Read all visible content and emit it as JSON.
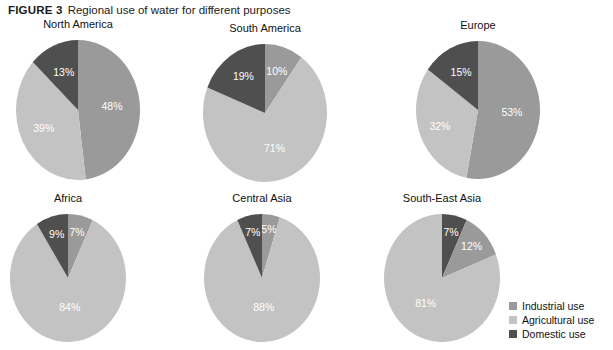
{
  "figure": {
    "label": "FIGURE 3",
    "title": "Regional use of water for different purposes"
  },
  "colors": {
    "industrial": "#9a9a9a",
    "agricultural": "#c3c3c3",
    "domestic": "#4f4f4f",
    "background": "#ffffff",
    "text": "#111111",
    "label_text": "#ffffff"
  },
  "legend": {
    "position": "bottom-right",
    "items": [
      {
        "label": "Industrial use",
        "key": "industrial",
        "color": "#9a9a9a"
      },
      {
        "label": "Agricultural use",
        "key": "agricultural",
        "color": "#c3c3c3"
      },
      {
        "label": "Domestic use",
        "key": "domestic",
        "color": "#4f4f4f"
      }
    ]
  },
  "chart_data": {
    "type": "pie",
    "title": "Regional use of water for different purposes",
    "subtitle": "",
    "xlabel": "",
    "ylabel": "",
    "unit": "percent",
    "legend": [
      "Industrial use",
      "Agricultural use",
      "Domestic use"
    ],
    "legend_position": "bottom-right",
    "grid": false,
    "categories": [
      "Industrial use",
      "Agricultural use",
      "Domestic use"
    ],
    "charts": [
      {
        "title": "North America",
        "row": 0,
        "col": 0,
        "cx": 78,
        "cy": 110,
        "rx": 62,
        "ry": 70,
        "start_angle": 0,
        "slices": [
          {
            "name": "Industrial use",
            "value": 48,
            "label": "48%",
            "color": "#9a9a9a",
            "label_r": 0.55
          },
          {
            "name": "Agricultural use",
            "value": 39,
            "label": "39%",
            "color": "#c3c3c3",
            "label_r": 0.62
          },
          {
            "name": "Domestic use",
            "value": 13,
            "label": "13%",
            "color": "#4f4f4f",
            "label_r": 0.58
          }
        ]
      },
      {
        "title": "South America",
        "row": 0,
        "col": 1,
        "cx": 265,
        "cy": 113,
        "rx": 62,
        "ry": 69,
        "start_angle": 0,
        "slices": [
          {
            "name": "Industrial use",
            "value": 10,
            "label": "10%",
            "color": "#9a9a9a",
            "label_r": 0.62
          },
          {
            "name": "Agricultural use",
            "value": 71,
            "label": "71%",
            "color": "#c3c3c3",
            "label_r": 0.55
          },
          {
            "name": "Domestic use",
            "value": 19,
            "label": "19%",
            "color": "#4f4f4f",
            "label_r": 0.62
          }
        ]
      },
      {
        "title": "Europe",
        "row": 0,
        "col": 2,
        "cx": 478,
        "cy": 110,
        "rx": 62,
        "ry": 69,
        "start_angle": 0,
        "slices": [
          {
            "name": "Industrial use",
            "value": 53,
            "label": "53%",
            "color": "#9a9a9a",
            "label_r": 0.55
          },
          {
            "name": "Agricultural use",
            "value": 32,
            "label": "32%",
            "color": "#c3c3c3",
            "label_r": 0.66
          },
          {
            "name": "Domestic use",
            "value": 15,
            "label": "15%",
            "color": "#4f4f4f",
            "label_r": 0.6
          }
        ]
      },
      {
        "title": "Africa",
        "row": 1,
        "col": 0,
        "cx": 68,
        "cy": 278,
        "rx": 58,
        "ry": 64,
        "start_angle": 0,
        "slices": [
          {
            "name": "Industrial use",
            "value": 7,
            "label": "7%",
            "color": "#9a9a9a",
            "label_r": 0.72
          },
          {
            "name": "Agricultural use",
            "value": 84,
            "label": "84%",
            "color": "#c3c3c3",
            "label_r": 0.48
          },
          {
            "name": "Domestic use",
            "value": 9,
            "label": "9%",
            "color": "#4f4f4f",
            "label_r": 0.7
          }
        ]
      },
      {
        "title": "Central Asia",
        "row": 1,
        "col": 1,
        "cx": 262,
        "cy": 278,
        "rx": 58,
        "ry": 64,
        "start_angle": 0,
        "slices": [
          {
            "name": "Industrial use",
            "value": 5,
            "label": "5%",
            "color": "#9a9a9a",
            "label_r": 0.76
          },
          {
            "name": "Agricultural use",
            "value": 88,
            "label": "88%",
            "color": "#c3c3c3",
            "label_r": 0.48
          },
          {
            "name": "Domestic use",
            "value": 7,
            "label": "7%",
            "color": "#4f4f4f",
            "label_r": 0.72
          }
        ]
      },
      {
        "title": "South-East Asia",
        "row": 1,
        "col": 2,
        "cx": 442,
        "cy": 278,
        "rx": 58,
        "ry": 64,
        "start_angle": 0,
        "slices": [
          {
            "name": "Domestic use",
            "value": 7,
            "label": "7%",
            "color": "#4f4f4f",
            "label_r": 0.72
          },
          {
            "name": "Industrial use",
            "value": 12,
            "label": "12%",
            "color": "#9a9a9a",
            "label_r": 0.7
          },
          {
            "name": "Agricultural use",
            "value": 81,
            "label": "81%",
            "color": "#c3c3c3",
            "label_r": 0.5
          }
        ]
      }
    ]
  }
}
